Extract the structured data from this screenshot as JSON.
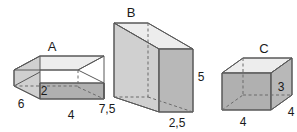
{
  "figure": {
    "background_color": "#ffffff",
    "stroke_color": "#595959",
    "hidden_edge_color": "#6b6b6b",
    "label_color": "#1a1a1a",
    "face_colors": {
      "top": "#ededed",
      "left": "#d0d0d0",
      "front": "#b0b0b0",
      "right": "#b8b8b8"
    },
    "solids": [
      {
        "name": "A",
        "name_label": "A",
        "shape": "rectangular-prism",
        "dimensions": [
          {
            "label": "6",
            "position": "bottom-left-depth"
          },
          {
            "label": "2",
            "position": "vertical-height"
          },
          {
            "label": "4",
            "position": "bottom-width"
          }
        ]
      },
      {
        "name": "B",
        "name_label": "B",
        "shape": "rectangular-prism",
        "dimensions": [
          {
            "label": "7,5",
            "position": "bottom-left-depth"
          },
          {
            "label": "2,5",
            "position": "bottom-width"
          },
          {
            "label": "5",
            "position": "vertical-height"
          }
        ]
      },
      {
        "name": "C",
        "name_label": "C",
        "shape": "rectangular-prism",
        "dimensions": [
          {
            "label": "3",
            "position": "vertical-height"
          },
          {
            "label": "4",
            "position": "bottom-width"
          },
          {
            "label": "4",
            "position": "bottom-right-depth"
          }
        ]
      }
    ]
  }
}
